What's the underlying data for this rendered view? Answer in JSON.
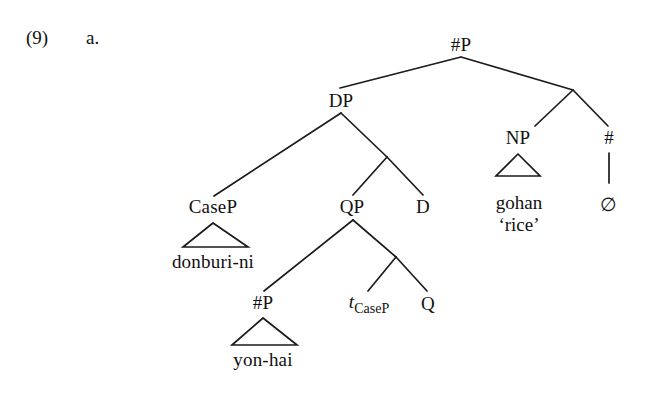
{
  "example": {
    "number": "(9)",
    "letter": "a."
  },
  "tree": {
    "nodes": {
      "root": "#P",
      "dp": "DP",
      "casep": "CaseP",
      "qp": "QP",
      "d": "D",
      "numberp_low": "#P",
      "trace_t": "t",
      "trace_sub": "CaseP",
      "q": "Q",
      "np": "NP",
      "num_head": "#"
    },
    "terminals": {
      "donburi": "donburi-ni",
      "yonhai": "yon-hai",
      "gohan": "gohan",
      "gohan_gloss": "‘rice’",
      "null": "∅"
    }
  },
  "style": {
    "ink": "#1b1b1b",
    "background": "#ffffff"
  }
}
